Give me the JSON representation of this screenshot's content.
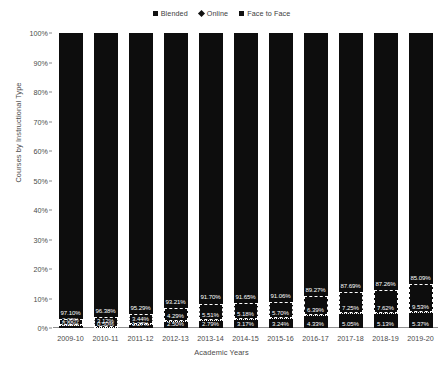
{
  "chart_data": {
    "type": "bar",
    "stacked": true,
    "title": "",
    "xlabel": "Academic Years",
    "ylabel": "Courses by Instructional Type",
    "ylim": [
      0,
      100
    ],
    "yticks": [
      "0%",
      "10%",
      "20%",
      "30%",
      "40%",
      "50%",
      "60%",
      "70%",
      "80%",
      "90%",
      "100%"
    ],
    "ytick_values": [
      0,
      10,
      20,
      30,
      40,
      50,
      60,
      70,
      80,
      90,
      100
    ],
    "grid": false,
    "legend_position": "top-center",
    "categories": [
      "2009-10",
      "2010-11",
      "2011-12",
      "2012-13",
      "2013-14",
      "2014-15",
      "2015-16",
      "2016-17",
      "2017-18",
      "2018-19",
      "2019-20"
    ],
    "series": [
      {
        "name": "Online",
        "marker": "diamond",
        "color": "#0d0d0d",
        "values": [
          0.9,
          0.5,
          1.27,
          2.5,
          2.79,
          3.17,
          3.24,
          4.33,
          5.05,
          5.13,
          5.37
        ],
        "labels": [
          "0.90%",
          "0.50%",
          "1.27%",
          "2.50%",
          "2.79%",
          "3.17%",
          "3.24%",
          "4.33%",
          "5.05%",
          "5.13%",
          "5.37%"
        ]
      },
      {
        "name": "Blended",
        "marker": "square",
        "color": "#0d0d0d",
        "values": [
          2.0,
          3.12,
          3.44,
          4.29,
          5.51,
          5.18,
          5.7,
          6.39,
          7.25,
          7.62,
          9.53
        ],
        "labels": [
          "2.00%",
          "3.12%",
          "3.44%",
          "4.29%",
          "5.51%",
          "5.18%",
          "5.70%",
          "6.39%",
          "7.25%",
          "7.62%",
          "9.53%"
        ]
      },
      {
        "name": "Face to Face",
        "marker": "square",
        "color": "#0d0d0d",
        "values": [
          97.1,
          96.38,
          95.29,
          93.21,
          91.7,
          91.65,
          91.06,
          89.27,
          87.69,
          87.26,
          85.09
        ],
        "labels": [
          "97.10%",
          "96.38%",
          "95.29%",
          "93.21%",
          "91.70%",
          "91.65%",
          "91.06%",
          "89.27%",
          "87.69%",
          "87.26%",
          "85.09%"
        ]
      }
    ],
    "legend": [
      "Blended",
      "Online",
      "Face to Face"
    ]
  }
}
